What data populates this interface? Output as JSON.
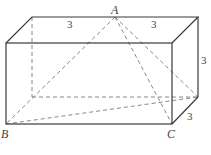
{
  "diagram": {
    "type": "rectangular-prism-with-pyramid",
    "vertices": {
      "A": {
        "label": "A"
      },
      "B": {
        "label": "B"
      },
      "C": {
        "label": "C"
      }
    },
    "dimensions": {
      "top_left_segment": "3",
      "top_right_segment": "3",
      "height": "3",
      "depth": "3"
    }
  }
}
